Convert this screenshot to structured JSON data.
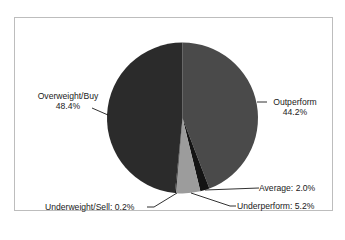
{
  "chart_data": {
    "type": "pie",
    "title": "",
    "start_angle_deg": 0,
    "direction": "clockwise",
    "slices": [
      {
        "label": "Outperform",
        "value": 44.2,
        "display": "44.2%",
        "color": "#4a4a4a"
      },
      {
        "label": "Average",
        "value": 2.0,
        "display": "Average: 2.0%",
        "color": "#141414"
      },
      {
        "label": "Underperform",
        "value": 5.2,
        "display": "Underperform: 5.2%",
        "color": "#9c9c9c"
      },
      {
        "label": "Underweight/Sell",
        "value": 0.2,
        "display": "Underweight/Sell: 0.2%",
        "color": "#0a0a0a"
      },
      {
        "label": "Overweight/Buy",
        "value": 48.4,
        "display": "48.4%",
        "color": "#2b2b2b"
      }
    ],
    "categories": [
      "Outperform",
      "Average",
      "Underperform",
      "Underweight/Sell",
      "Overweight/Buy"
    ],
    "values": [
      44.2,
      2.0,
      5.2,
      0.2,
      48.4
    ],
    "legend": "none (leader-line labels)"
  },
  "labels": {
    "overweight_name": "Overweight/Buy",
    "overweight_pct": "48.4%",
    "outperform_name": "Outperform",
    "outperform_pct": "44.2%",
    "average": "Average: 2.0%",
    "underperform": "Underperform: 5.2%",
    "underweight": "Underweight/Sell: 0.2%"
  }
}
